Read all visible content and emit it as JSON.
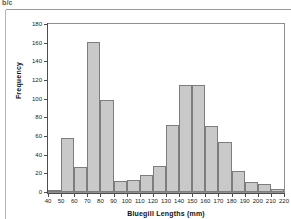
{
  "page": {
    "header_fragment": "b/c",
    "background_color": "#ffffff"
  },
  "chart_data": {
    "type": "bar",
    "title": "",
    "subtitle": "",
    "xlabel": "Bluegill Lengths (mm)",
    "ylabel": "Frequency",
    "xlim": [
      40,
      220
    ],
    "ylim": [
      0,
      180
    ],
    "bin_width": 10,
    "grid": false,
    "legend": "none",
    "bar_fill_color": "#c9c9c9",
    "bar_edge_color": "#7d7d7d",
    "axis_color": "#4d4d4d",
    "frame": true,
    "x_ticks": [
      40,
      50,
      60,
      70,
      80,
      90,
      100,
      110,
      120,
      130,
      140,
      150,
      160,
      170,
      180,
      190,
      200,
      210,
      220
    ],
    "y_ticks": [
      0,
      20,
      40,
      60,
      80,
      100,
      120,
      140,
      160,
      180
    ],
    "bins": [
      {
        "from": 40,
        "to": 50,
        "label": "40-50",
        "value": 2
      },
      {
        "from": 50,
        "to": 60,
        "label": "50-60",
        "value": 58
      },
      {
        "from": 60,
        "to": 70,
        "label": "60-70",
        "value": 27
      },
      {
        "from": 70,
        "to": 80,
        "label": "70-80",
        "value": 161
      },
      {
        "from": 80,
        "to": 90,
        "label": "80-90",
        "value": 99
      },
      {
        "from": 90,
        "to": 100,
        "label": "90-100",
        "value": 12
      },
      {
        "from": 100,
        "to": 110,
        "label": "100-110",
        "value": 13
      },
      {
        "from": 110,
        "to": 120,
        "label": "110-120",
        "value": 18
      },
      {
        "from": 120,
        "to": 130,
        "label": "120-130",
        "value": 28
      },
      {
        "from": 130,
        "to": 140,
        "label": "130-140",
        "value": 72
      },
      {
        "from": 140,
        "to": 150,
        "label": "140-150",
        "value": 115
      },
      {
        "from": 150,
        "to": 160,
        "label": "150-160",
        "value": 115
      },
      {
        "from": 160,
        "to": 170,
        "label": "160-170",
        "value": 71
      },
      {
        "from": 170,
        "to": 180,
        "label": "170-180",
        "value": 54
      },
      {
        "from": 180,
        "to": 190,
        "label": "180-190",
        "value": 23
      },
      {
        "from": 190,
        "to": 200,
        "label": "190-200",
        "value": 11
      },
      {
        "from": 200,
        "to": 210,
        "label": "200-210",
        "value": 9
      },
      {
        "from": 210,
        "to": 220,
        "label": "210-220",
        "value": 3
      }
    ],
    "categories": [
      "40-50",
      "50-60",
      "60-70",
      "70-80",
      "80-90",
      "90-100",
      "100-110",
      "110-120",
      "120-130",
      "130-140",
      "140-150",
      "150-160",
      "160-170",
      "170-180",
      "180-190",
      "190-200",
      "200-210",
      "210-220"
    ],
    "values": [
      2,
      58,
      27,
      161,
      99,
      12,
      13,
      18,
      28,
      72,
      115,
      115,
      71,
      54,
      23,
      11,
      9,
      3
    ]
  }
}
